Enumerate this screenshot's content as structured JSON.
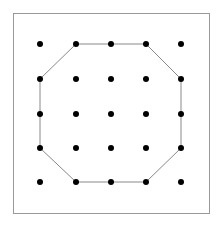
{
  "diagram": {
    "type": "geoboard-octagon",
    "frame": {
      "x": 13,
      "y": 13,
      "width": 196,
      "height": 200,
      "stroke": "#999999"
    },
    "grid": {
      "columns": [
        40,
        76,
        111,
        146,
        181
      ],
      "rows": [
        44,
        79,
        114,
        148,
        182
      ],
      "dot_radius": 3,
      "dot_color": "#000000"
    },
    "polygon": {
      "shape": "octagon",
      "stroke": "#888888",
      "vertices": [
        [
          1,
          0
        ],
        [
          3,
          0
        ],
        [
          4,
          1
        ],
        [
          4,
          3
        ],
        [
          3,
          4
        ],
        [
          1,
          4
        ],
        [
          0,
          3
        ],
        [
          0,
          1
        ]
      ]
    }
  }
}
